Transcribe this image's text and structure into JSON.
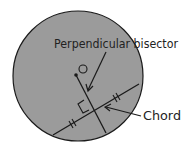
{
  "diagram": {
    "labels": {
      "perpendicular_bisector": "Perpendicular bisector",
      "chord": "Chord",
      "center": "O"
    },
    "colors": {
      "circle_fill": "#9b9b9b",
      "stroke": "#1a1a1a",
      "background": "#ffffff"
    }
  }
}
